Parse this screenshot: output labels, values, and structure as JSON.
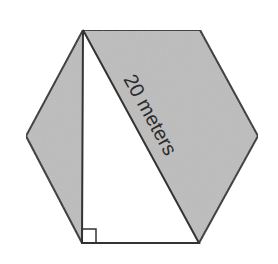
{
  "diagram": {
    "type": "geometry",
    "shape": "regular-hexagon",
    "colors": {
      "background": "#ffffff",
      "shaded_fill": "#bdbdbd",
      "triangle_fill": "#ffffff",
      "stroke": "#333333",
      "label": "#2b2b2b"
    },
    "hexagon_vertices": [
      [
        83,
        30
      ],
      [
        200,
        30
      ],
      [
        258,
        136
      ],
      [
        199,
        243
      ],
      [
        82,
        243
      ],
      [
        26,
        136
      ]
    ],
    "triangle_vertices": [
      [
        83,
        30
      ],
      [
        82,
        243
      ],
      [
        199,
        243
      ]
    ],
    "right_angle_marker": {
      "x": 82,
      "y": 229,
      "size": 14
    },
    "labels": {
      "hypotenuse": "20 meters"
    }
  }
}
